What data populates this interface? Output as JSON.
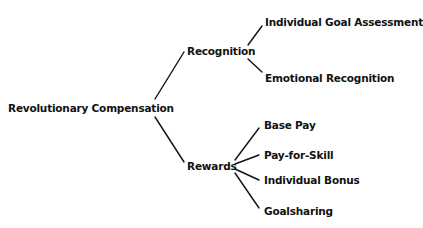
{
  "diagram": {
    "type": "tree",
    "root": {
      "label": "Revolutionary Compensation",
      "children": [
        {
          "label": "Recognition",
          "children": [
            {
              "label": "Individual Goal Assessment"
            },
            {
              "label": "Emotional Recognition"
            }
          ]
        },
        {
          "label": "Rewards",
          "children": [
            {
              "label": "Base Pay"
            },
            {
              "label": "Pay-for-Skill"
            },
            {
              "label": "Individual Bonus"
            },
            {
              "label": "Goalsharing"
            }
          ]
        }
      ]
    },
    "line_color": "#111111",
    "text_color": "#111111",
    "background": "#ffffff"
  }
}
